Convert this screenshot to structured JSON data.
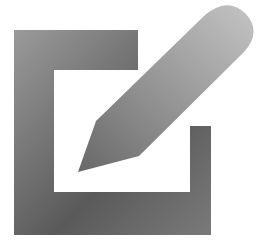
{
  "icon": {
    "name": "edit-icon",
    "description": "Square frame with a pencil writing diagonally into it",
    "colors": {
      "background": "#ffffff",
      "frame_light": "#9a9a9a",
      "frame_dark": "#4a4a4a",
      "pencil_light": "#bdbdbd",
      "pencil_dark": "#6e6e6e"
    }
  }
}
